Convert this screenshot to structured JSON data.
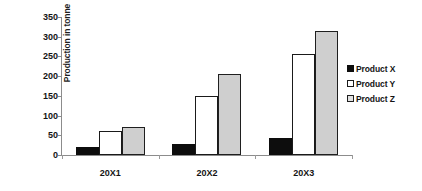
{
  "chart_data": {
    "type": "bar",
    "title": "",
    "subtitle": "",
    "xlabel": "",
    "ylabel": "Production in tonne",
    "categories": [
      "20X1",
      "20X2",
      "20X3"
    ],
    "series": [
      {
        "name": "Product X",
        "values": [
          20,
          28,
          43
        ],
        "color": "#0d0d0d"
      },
      {
        "name": "Product Y",
        "values": [
          60,
          150,
          255
        ],
        "color": "#ffffff"
      },
      {
        "name": "Product Z",
        "values": [
          70,
          205,
          315
        ],
        "color": "#cfcfcf"
      }
    ],
    "ylim": [
      0,
      350
    ],
    "ytick_step": 50,
    "yticks": [
      350,
      300,
      250,
      200,
      150,
      100,
      50,
      0
    ],
    "ytick_labels": [
      "350",
      "300",
      "250",
      "200",
      "150",
      "100",
      "50",
      "0"
    ],
    "grid": false,
    "legend_position": "right",
    "legend_entries": [
      "Product X",
      "Product Y",
      "Product Z"
    ],
    "annotations": []
  }
}
